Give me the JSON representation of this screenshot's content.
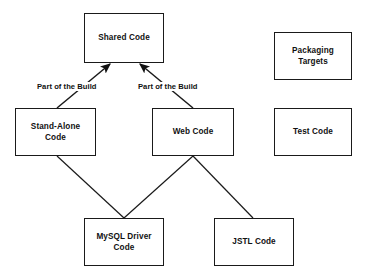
{
  "diagram": {
    "background_color": "#ffffff",
    "stroke_color": "#1a1a1a",
    "text_color": "#111111",
    "nodes": [
      {
        "id": "shared-code",
        "label": "Shared Code",
        "x": 84,
        "y": 13,
        "w": 80,
        "h": 50
      },
      {
        "id": "packaging-targets",
        "label": "Packaging\nTargets",
        "x": 274,
        "y": 32,
        "w": 78,
        "h": 48
      },
      {
        "id": "stand-alone-code",
        "label": "Stand-Alone\nCode",
        "x": 15,
        "y": 108,
        "w": 81,
        "h": 48
      },
      {
        "id": "web-code",
        "label": "Web Code",
        "x": 152,
        "y": 108,
        "w": 82,
        "h": 48
      },
      {
        "id": "test-code",
        "label": "Test Code",
        "x": 274,
        "y": 108,
        "w": 78,
        "h": 48
      },
      {
        "id": "mysql-driver-code",
        "label": "MySQL Driver\nCode",
        "x": 84,
        "y": 218,
        "w": 80,
        "h": 48
      },
      {
        "id": "jstl-code",
        "label": "JSTL Code",
        "x": 214,
        "y": 218,
        "w": 80,
        "h": 48
      }
    ],
    "edges": [
      {
        "id": "stand-alone-to-shared",
        "from": "stand-alone-code",
        "to": "shared-code",
        "label": "Part of the Build",
        "arrow": true,
        "x1": 57,
        "y1": 108,
        "x2": 110,
        "y2": 64,
        "label_x": 36,
        "label_y": 82
      },
      {
        "id": "web-to-shared",
        "from": "web-code",
        "to": "shared-code",
        "label": "Part of the Build",
        "arrow": true,
        "x1": 193,
        "y1": 108,
        "x2": 140,
        "y2": 64,
        "label_x": 137,
        "label_y": 82
      },
      {
        "id": "stand-alone-to-mysql",
        "from": "stand-alone-code",
        "to": "mysql-driver-code",
        "label": "",
        "arrow": false,
        "x1": 57,
        "y1": 156,
        "x2": 124,
        "y2": 218
      },
      {
        "id": "web-to-mysql",
        "from": "web-code",
        "to": "mysql-driver-code",
        "label": "",
        "arrow": false,
        "x1": 193,
        "y1": 156,
        "x2": 124,
        "y2": 218
      },
      {
        "id": "web-to-jstl",
        "from": "web-code",
        "to": "jstl-code",
        "label": "",
        "arrow": false,
        "x1": 193,
        "y1": 156,
        "x2": 253,
        "y2": 218
      }
    ]
  }
}
